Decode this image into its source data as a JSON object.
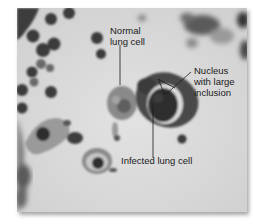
{
  "figure": {
    "labels": {
      "normal_cell": "Normal\nlung cell",
      "nucleus": "Nucleus\nwith large\ninclusion",
      "infected_cell": "Infected lung cell"
    },
    "colors": {
      "background": "#d9d9d9",
      "dark_cell": "#3a3a3a",
      "text": "#1a1a1a"
    }
  }
}
